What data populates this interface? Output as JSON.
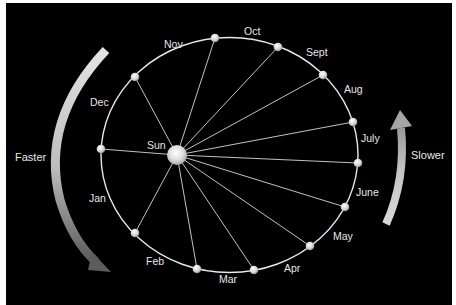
{
  "diagram": {
    "center_label": "Sun",
    "left_arrow_label": "Faster",
    "right_arrow_label": "Slower",
    "colors": {
      "background": "#000000",
      "frame": "#ffffff",
      "orbit": "#e8e8e8",
      "rays": "#d8d8d8",
      "text": "#e6e6e6"
    },
    "months": [
      {
        "label": "Nov",
        "planet": [
          215,
          38
        ],
        "text": [
          164,
          48
        ]
      },
      {
        "label": "Oct",
        "planet": [
          278,
          47
        ],
        "text": [
          244,
          35
        ]
      },
      {
        "label": "Sept",
        "planet": [
          323,
          75
        ],
        "text": [
          306,
          56
        ]
      },
      {
        "label": "Aug",
        "planet": [
          353,
          122
        ],
        "text": [
          344,
          93
        ]
      },
      {
        "label": "July",
        "planet": [
          358,
          163
        ],
        "text": [
          361,
          142
        ]
      },
      {
        "label": "June",
        "planet": [
          345,
          207
        ],
        "text": [
          356,
          196
        ]
      },
      {
        "label": "May",
        "planet": [
          310,
          246
        ],
        "text": [
          333,
          240
        ]
      },
      {
        "label": "Apr",
        "planet": [
          254,
          270
        ],
        "text": [
          284,
          272
        ]
      },
      {
        "label": "Mar",
        "planet": [
          197,
          269
        ],
        "text": [
          219,
          283
        ]
      },
      {
        "label": "Feb",
        "planet": [
          135,
          233
        ],
        "text": [
          146,
          265
        ]
      },
      {
        "label": "Jan",
        "planet": [
          101,
          149
        ],
        "text": [
          89,
          202
        ]
      },
      {
        "label": "Dec",
        "planet": [
          135,
          77
        ],
        "text": [
          90,
          106
        ]
      }
    ]
  }
}
